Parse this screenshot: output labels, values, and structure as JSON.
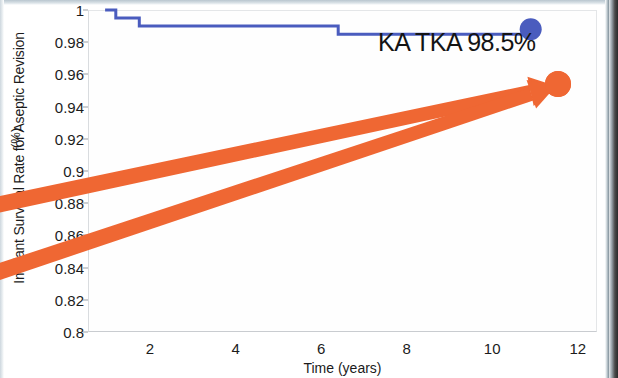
{
  "figure": {
    "plot": {
      "left": 88,
      "top": 10,
      "width": 509,
      "height": 322,
      "x_min": 0.55,
      "x_max": 12.45,
      "y_min": 0.8,
      "y_max": 1.0
    }
  },
  "chart_data": {
    "type": "line",
    "title": "",
    "xlabel": "Time (years)",
    "ylabel": "Implant Survival Rate for Aseptic Revision",
    "ylabel_unit": "(%)",
    "xlim": [
      0.55,
      12.45
    ],
    "ylim": [
      0.8,
      1.0
    ],
    "xticks": [
      2,
      4,
      6,
      8,
      10,
      12
    ],
    "xtick_labels": [
      "2",
      "4",
      "6",
      "8",
      "10",
      "12"
    ],
    "yticks": [
      0.8,
      0.82,
      0.84,
      0.86,
      0.88,
      0.9,
      0.92,
      0.94,
      0.96,
      0.98,
      1.0
    ],
    "ytick_labels": [
      "0.8",
      "0.82",
      "0.84",
      "0.86",
      "0.88",
      "0.9",
      "0.92",
      "0.94",
      "0.96",
      "0.98",
      "1"
    ],
    "grid": false,
    "legend": "none",
    "series": [
      {
        "name": "KA TKA survivorship",
        "type": "step",
        "color": "#4a5cbe",
        "linewidth": 3,
        "x": [
          0.95,
          1.2,
          1.2,
          1.75,
          1.75,
          6.4,
          6.4,
          10.9
        ],
        "y": [
          1.0,
          1.0,
          0.995,
          0.995,
          0.99,
          0.99,
          0.985,
          0.985
        ],
        "endpoint": {
          "x": 10.9,
          "y": 0.988,
          "marker": "circle",
          "color": "#4a5cbe",
          "radius": 11
        }
      }
    ],
    "annotations": [
      {
        "name": "ka-tka-survival-label",
        "text": "KA TKA 98.5%",
        "x": 378,
        "y": 28,
        "color": "#141414",
        "fontsize": 25
      },
      {
        "name": "orange-arrow-upper",
        "type": "arrow",
        "color": "#ef6733",
        "from": [
          -8,
          206
        ],
        "to": [
          556,
          86
        ],
        "linewidth": 13
      },
      {
        "name": "orange-arrow-lower",
        "type": "arrow",
        "color": "#ef6733",
        "from": [
          -8,
          274
        ],
        "to": [
          556,
          86
        ],
        "linewidth": 13
      }
    ]
  },
  "colors": {
    "curve_blue": "#4a5cbe",
    "arrow_orange": "#ef6733",
    "text": "#1c1c1c",
    "plot_background": "#fefefe"
  }
}
